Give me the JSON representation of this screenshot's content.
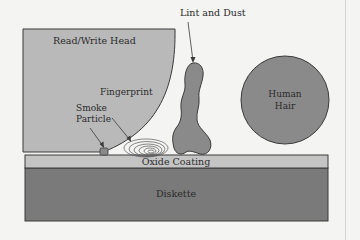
{
  "diagram": {
    "labels": {
      "head": "Read/Write Head",
      "lint": "Lint and Dust",
      "fingerprint": "Fingerprint",
      "smoke_line1": "Smoke",
      "smoke_line2": "Particle",
      "hair_line1": "Human",
      "hair_line2": "Hair",
      "oxide": "Oxide Coating",
      "diskette": "Diskette"
    },
    "colors": {
      "background": "#f4f4f2",
      "head_fill": "#b9b9b9",
      "oxide_fill": "#c4c4c4",
      "diskette_fill": "#7a7a7a",
      "particle_fill": "#8a8a8a",
      "outline": "#3a3a3a"
    }
  }
}
